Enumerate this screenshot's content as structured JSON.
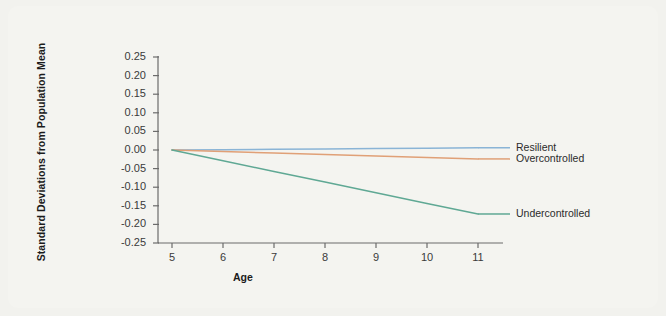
{
  "chart_data": {
    "type": "line",
    "title": "",
    "xlabel": "Age",
    "ylabel": "Standard Deviations from Population Mean",
    "x": [
      5,
      6,
      7,
      8,
      9,
      10,
      11
    ],
    "xlim": [
      4.6,
      11.4
    ],
    "ylim": [
      -0.25,
      0.25
    ],
    "xticks": [
      "5",
      "6",
      "7",
      "8",
      "9",
      "10",
      "11"
    ],
    "yticks": [
      "0.25",
      "0.20",
      "0.15",
      "0.10",
      "0.05",
      "0.00",
      "-0.05",
      "-0.10",
      "-0.15",
      "-0.20",
      "-0.25"
    ],
    "ytick_values": [
      0.25,
      0.2,
      0.15,
      0.1,
      0.05,
      0,
      -0.05,
      -0.1,
      -0.15,
      -0.2,
      -0.25
    ],
    "grid": false,
    "legend_position": "right-inline",
    "series": [
      {
        "name": "Resilient",
        "color": "#8ab4d6",
        "values": [
          0.0,
          0.001,
          0.002,
          0.003,
          0.004,
          0.005,
          0.006
        ]
      },
      {
        "name": "Overcontrolled",
        "color": "#e0a077",
        "values": [
          0.0,
          -0.004,
          -0.008,
          -0.012,
          -0.016,
          -0.02,
          -0.024
        ]
      },
      {
        "name": "Undercontrolled",
        "color": "#5fa894",
        "values": [
          0.0,
          -0.029,
          -0.058,
          -0.086,
          -0.115,
          -0.144,
          -0.172
        ]
      }
    ]
  },
  "axes": {
    "axis_color": "#6b6b6b",
    "background": "#f4f4f0",
    "page_background": "#f2f2ee"
  }
}
